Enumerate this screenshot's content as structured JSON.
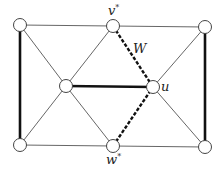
{
  "diagram": {
    "type": "graph",
    "width": 223,
    "height": 171,
    "colors": {
      "background": "#ffffff",
      "thin_edge": "#555555",
      "thick_edge": "#111111",
      "dashed_edge": "#111111",
      "node_fill": "#ffffff",
      "node_stroke": "#444444",
      "label": "#222222"
    },
    "node_radius": 6.5,
    "nodes": [
      {
        "id": "tl",
        "x": 20,
        "y": 25,
        "label": ""
      },
      {
        "id": "vstar",
        "x": 113,
        "y": 26,
        "label": "v*"
      },
      {
        "id": "tr",
        "x": 205,
        "y": 27,
        "label": ""
      },
      {
        "id": "ml",
        "x": 66,
        "y": 86,
        "label": ""
      },
      {
        "id": "u",
        "x": 153,
        "y": 87,
        "label": "u"
      },
      {
        "id": "bl",
        "x": 20,
        "y": 145,
        "label": ""
      },
      {
        "id": "wstar",
        "x": 113,
        "y": 146,
        "label": "w*"
      },
      {
        "id": "br",
        "x": 205,
        "y": 147,
        "label": ""
      }
    ],
    "edges": [
      {
        "from": "tl",
        "to": "vstar",
        "style": "thin"
      },
      {
        "from": "vstar",
        "to": "tr",
        "style": "thin"
      },
      {
        "from": "bl",
        "to": "wstar",
        "style": "thin"
      },
      {
        "from": "wstar",
        "to": "br",
        "style": "thin"
      },
      {
        "from": "tl",
        "to": "bl",
        "style": "thick"
      },
      {
        "from": "tr",
        "to": "br",
        "style": "thick"
      },
      {
        "from": "ml",
        "to": "u",
        "style": "thick"
      },
      {
        "from": "tl",
        "to": "ml",
        "style": "thin"
      },
      {
        "from": "bl",
        "to": "ml",
        "style": "thin"
      },
      {
        "from": "vstar",
        "to": "ml",
        "style": "thin"
      },
      {
        "from": "wstar",
        "to": "ml",
        "style": "thin"
      },
      {
        "from": "vstar",
        "to": "u",
        "style": "dashed"
      },
      {
        "from": "wstar",
        "to": "u",
        "style": "dashed"
      },
      {
        "from": "tr",
        "to": "u",
        "style": "thin"
      },
      {
        "from": "br",
        "to": "u",
        "style": "thin"
      }
    ],
    "labels": [
      {
        "id": "vstar-label",
        "text": "v",
        "sup": "*",
        "x": 108,
        "y": 15
      },
      {
        "id": "W-label",
        "text": "W",
        "sup": "",
        "x": 133,
        "y": 53
      },
      {
        "id": "u-label",
        "text": "u",
        "sup": "",
        "x": 161,
        "y": 91
      },
      {
        "id": "wstar-label",
        "text": "w",
        "sup": "*",
        "x": 106,
        "y": 164
      }
    ]
  }
}
